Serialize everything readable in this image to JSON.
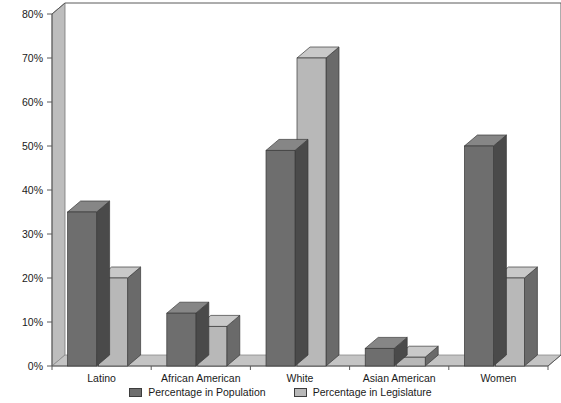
{
  "chart_data": {
    "type": "bar",
    "title": "",
    "xlabel": "",
    "ylabel": "",
    "ylim": [
      0,
      80
    ],
    "ytick_labels": [
      "0%",
      "10%",
      "20%",
      "30%",
      "40%",
      "50%",
      "60%",
      "70%",
      "80%"
    ],
    "ytick_values": [
      0,
      10,
      20,
      30,
      40,
      50,
      60,
      70,
      80
    ],
    "grid": false,
    "legend_position": "bottom",
    "categories": [
      "Latino",
      "African American",
      "White",
      "Asian American",
      "Women"
    ],
    "series": [
      {
        "name": "Percentage in Population",
        "color": "#6e6e6e",
        "values": [
          35,
          12,
          49,
          4,
          50
        ]
      },
      {
        "name": "Percentage in Legislature",
        "color": "#b8b8b8",
        "values": [
          20,
          9,
          70,
          2,
          20
        ]
      }
    ]
  },
  "legend": {
    "items": [
      {
        "label": "Percentage in Population",
        "swatch": "#6e6e6e"
      },
      {
        "label": "Percentage in Legislature",
        "swatch": "#b8b8b8"
      }
    ]
  },
  "colors": {
    "bar_dark_face": "#6e6e6e",
    "bar_dark_side": "#4a4a4a",
    "bar_dark_top": "#868686",
    "bar_light_face": "#b8b8b8",
    "bar_light_side": "#6a6a6a",
    "bar_light_top": "#c9c9c9",
    "wall": "#bdbdbd",
    "floor": "#c4c4c4",
    "frame": "#5a5a5a",
    "text": "#1a1a1a"
  }
}
